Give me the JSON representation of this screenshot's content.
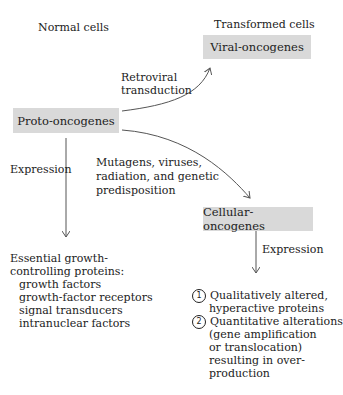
{
  "headers": {
    "left": "Normal cells",
    "right": "Transformed cells"
  },
  "nodes": {
    "proto": "Proto-oncogenes",
    "viral": "Viral-oncogenes",
    "cellular": "Cellular-oncogenes"
  },
  "edges": {
    "retroviral_line1": "Retroviral",
    "retroviral_line2": "transduction",
    "mutagens_line1": "Mutagens, viruses,",
    "mutagens_line2": "radiation, and genetic",
    "mutagens_line3": "predisposition",
    "expression_left": "Expression",
    "expression_right": "Expression"
  },
  "normal_outcome": {
    "line1": "Essential growth-",
    "line2": "controlling proteins:",
    "items": [
      "growth factors",
      "growth-factor receptors",
      "signal transducers",
      "intranuclear factors"
    ]
  },
  "transformed_outcome": {
    "item1_num": "1",
    "item1_line1": "Qualitatively altered,",
    "item1_line2": "hyperactive proteins",
    "item2_num": "2",
    "item2_lines": [
      "Quantitative alterations",
      "(gene amplification",
      "or translocation)",
      "resulting in over-",
      "production"
    ]
  },
  "colors": {
    "box_fill": "#d9d9d9",
    "arrow": "#555555"
  }
}
